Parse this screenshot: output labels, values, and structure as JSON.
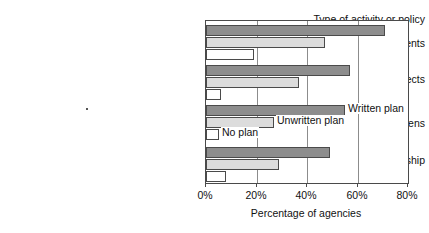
{
  "chart_data": {
    "type": "bar",
    "orientation": "horizontal",
    "title": "",
    "xlabel": "Percentage of agencies",
    "ylabel": "Type of activity or policy",
    "xlim": [
      0,
      80
    ],
    "xticks": [
      0,
      20,
      40,
      60,
      80
    ],
    "xtick_labels": [
      "0%",
      "20%",
      "40%",
      "60%",
      "80%"
    ],
    "grid": true,
    "legend_position": "inline-at-bar-ends",
    "categories": [
      "Geographic patrol assignments",
      "Officer problem-solving projects",
      "Community policing training for citizens",
      "Problem-solving partnership"
    ],
    "series": [
      {
        "name": "Written plan",
        "color": "#8d8d8d",
        "values": [
          71,
          57,
          55,
          49
        ]
      },
      {
        "name": "Unwritten plan",
        "color": "#dcdcdc",
        "values": [
          47,
          37,
          27,
          29
        ]
      },
      {
        "name": "No plan",
        "color": "#ffffff",
        "values": [
          19,
          6,
          5,
          8
        ]
      }
    ]
  },
  "labels": {
    "axis_heading": "Type of activity or policy",
    "categories": [
      "Geographic patrol assignments",
      "Officer problem-solving projects",
      "Community policing training for citizens",
      "Problem-solving partnership"
    ],
    "x_axis_title": "Percentage of agencies",
    "x_ticks": [
      "0%",
      "20%",
      "40%",
      "60%",
      "80%"
    ],
    "legend": [
      "Written plan",
      "Unwritten plan",
      "No plan"
    ]
  },
  "colors": {
    "written_plan": "#8d8d8d",
    "unwritten_plan": "#dcdcdc",
    "no_plan": "#ffffff",
    "outline": "#4a4a4a",
    "gridline": "#8c8c8c",
    "text": "#111111"
  }
}
